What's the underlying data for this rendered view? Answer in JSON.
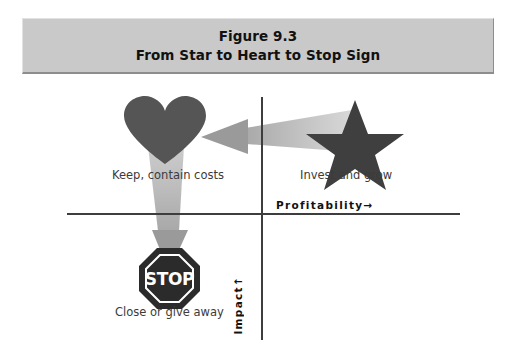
{
  "figure": {
    "title_line1": "Figure 9.3",
    "title_line2": "From Star to Heart to Stop Sign",
    "banner_color": "#c9c9c9"
  },
  "axes": {
    "x_label": "Profitability",
    "x_arrow": "→",
    "y_label": "Impact",
    "y_arrow": "↑",
    "axis_color": "#3d3d3d"
  },
  "quadrants": [
    {
      "id": "heart",
      "label": "Keep, contain costs",
      "icon": "heart-icon",
      "position": "upper-left",
      "color": "#555555"
    },
    {
      "id": "star",
      "label": "Invest and grow",
      "icon": "star-icon",
      "position": "upper-right",
      "color": "#3f3f3f"
    },
    {
      "id": "stop",
      "label": "Close or give away",
      "icon": "stop-sign-icon",
      "sign_text": "STOP",
      "position": "lower-left",
      "color": "#2b2b2b"
    }
  ],
  "arrows": [
    {
      "id": "star-to-heart",
      "from": "star",
      "to": "heart",
      "direction": "left",
      "color": "#b5b5b5"
    },
    {
      "id": "heart-to-stop",
      "from": "heart",
      "to": "stop",
      "direction": "down",
      "color": "#b5b5b5"
    }
  ]
}
